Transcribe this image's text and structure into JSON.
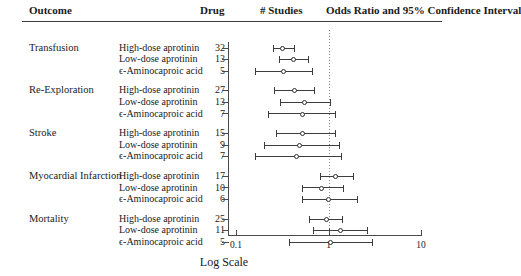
{
  "header": {
    "outcome": "Outcome",
    "drug": "Drug",
    "studies": "# Studies",
    "odds_ratio": "Odds Ratio and 95% Confidence Interval"
  },
  "axis": {
    "title": "Log Scale",
    "ticks": [
      "0.1",
      "1",
      "10"
    ],
    "reference_value": "1"
  },
  "chart_data": {
    "type": "scatter",
    "title": "Odds Ratio and 95% Confidence Interval",
    "xlabel": "Log Scale",
    "ylabel": "",
    "xscale": "log",
    "xlim": [
      0.1,
      10
    ],
    "xticks": [
      0.1,
      1,
      10
    ],
    "grid": false,
    "reference_line": 1,
    "legend": "none",
    "columns": [
      "Outcome",
      "Drug",
      "# Studies",
      "Odds Ratio and 95% Confidence Interval"
    ],
    "groups": [
      {
        "outcome": "Transfusion",
        "rows": [
          {
            "drug": "High-dose aprotinin",
            "studies": 32,
            "or": 0.32,
            "lo": 0.25,
            "hi": 0.42
          },
          {
            "drug": "Low-dose aprotinin",
            "studies": 13,
            "or": 0.42,
            "lo": 0.29,
            "hi": 0.6
          },
          {
            "drug": "ϵ-Aminocaproic acid",
            "studies": 5,
            "or": 0.33,
            "lo": 0.16,
            "hi": 0.66
          }
        ]
      },
      {
        "outcome": "Re-Exploration",
        "rows": [
          {
            "drug": "High-dose aprotinin",
            "studies": 27,
            "or": 0.43,
            "lo": 0.26,
            "hi": 0.69
          },
          {
            "drug": "Low-dose aprotinin",
            "studies": 13,
            "or": 0.55,
            "lo": 0.3,
            "hi": 1.05
          },
          {
            "drug": "ϵ-Aminocaproic acid",
            "studies": 7,
            "or": 0.52,
            "lo": 0.22,
            "hi": 1.18
          }
        ]
      },
      {
        "outcome": "Stroke",
        "rows": [
          {
            "drug": "High-dose aprotinin",
            "studies": 15,
            "or": 0.53,
            "lo": 0.27,
            "hi": 1.18
          },
          {
            "drug": "Low-dose aprotinin",
            "studies": 9,
            "or": 0.49,
            "lo": 0.2,
            "hi": 1.3
          },
          {
            "drug": "ϵ-Aminocaproic acid",
            "studies": 7,
            "or": 0.45,
            "lo": 0.16,
            "hi": 1.35
          }
        ]
      },
      {
        "outcome": "Myocardial Infarction",
        "rows": [
          {
            "drug": "High-dose aprotinin",
            "studies": 17,
            "or": 1.2,
            "lo": 0.8,
            "hi": 1.85
          },
          {
            "drug": "Low-dose aprotinin",
            "studies": 10,
            "or": 0.85,
            "lo": 0.52,
            "hi": 1.45
          },
          {
            "drug": "ϵ-Aminocaproic acid",
            "studies": 6,
            "or": 1.0,
            "lo": 0.52,
            "hi": 2.05
          }
        ]
      },
      {
        "outcome": "Mortality",
        "rows": [
          {
            "drug": "High-dose aprotinin",
            "studies": 25,
            "or": 0.95,
            "lo": 0.62,
            "hi": 1.4
          },
          {
            "drug": "Low-dose aprotinin",
            "studies": 11,
            "or": 1.35,
            "lo": 0.68,
            "hi": 2.6
          },
          {
            "drug": "ϵ-Aminocaproic acid",
            "studies": 5,
            "or": 1.05,
            "lo": 0.37,
            "hi": 2.95
          }
        ]
      }
    ]
  }
}
